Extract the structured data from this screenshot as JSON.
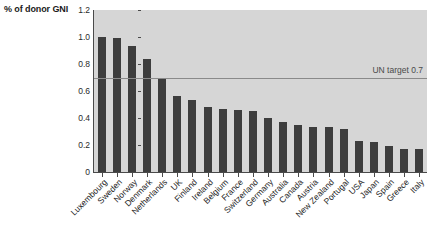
{
  "axis_title": "% of donor GNI",
  "colors": {
    "plot_background": "#d6d6d6",
    "bar": "#3d3d3d",
    "axis": "#4a4a4a",
    "target_line": "#8a8a8a",
    "page_background": "#ffffff",
    "text": "#1c1c1c"
  },
  "annotation": {
    "un_target_label": "UN target 0.7",
    "un_target_value": 0.7
  },
  "y_ticks": [
    "0",
    "0.2",
    "0.4",
    "0.6",
    "0.8",
    "1.0",
    "1.2"
  ],
  "chart_data": {
    "type": "bar",
    "title": "",
    "subtitle": "",
    "xlabel": "",
    "ylabel": "% of donor GNI",
    "ylim": [
      0,
      1.2
    ],
    "ytick_values": [
      0,
      0.2,
      0.4,
      0.6,
      0.8,
      1.0,
      1.2
    ],
    "grid": false,
    "legend": "none",
    "orientation": "vertical",
    "annotations": [
      {
        "type": "hline",
        "value": 0.7,
        "label": "UN target 0.7",
        "label_position": "right-above"
      }
    ],
    "categories": [
      "Luxembourg",
      "Sweden",
      "Norway",
      "Denmark",
      "Netherlands",
      "UK",
      "Finland",
      "Ireland",
      "Belgium",
      "France",
      "Switzerland",
      "Germany",
      "Australia",
      "Canada",
      "Austria",
      "New Zealand",
      "Portugal",
      "USA",
      "Japan",
      "Spain",
      "Greece",
      "Italy"
    ],
    "values": [
      1.0,
      0.99,
      0.93,
      0.84,
      0.7,
      0.56,
      0.53,
      0.48,
      0.47,
      0.46,
      0.45,
      0.4,
      0.37,
      0.35,
      0.33,
      0.33,
      0.32,
      0.23,
      0.22,
      0.19,
      0.17,
      0.17
    ]
  }
}
